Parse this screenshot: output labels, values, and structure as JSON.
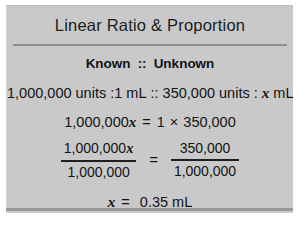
{
  "card": {
    "title": "Linear Ratio & Proportion",
    "header": {
      "known_label": "Known",
      "separator": "::",
      "unknown_label": "Unknown"
    },
    "proportion": {
      "known_quantity": "1,000,000 units",
      "known_ratio_sep": ":",
      "known_volume": "1 mL",
      "proportion_sep": "::",
      "unknown_quantity": "350,000 units",
      "unknown_ratio_sep": ":",
      "unknown_variable": "x",
      "unknown_volume": "mL",
      "full_text": "1,000,000 units :1 mL :: 350,000 units : x mL"
    },
    "cross_multiply": {
      "left_coefficient": "1,000,000",
      "left_variable": "x",
      "equals": "=",
      "right_factor_1": "1",
      "times": "×",
      "right_factor_2": "350,000",
      "full_text": "1,000,000x = 1 × 350,000"
    },
    "division_step": {
      "left_numerator": "1,000,000",
      "left_numerator_variable": "x",
      "left_denominator": "1,000,000",
      "equals": "=",
      "right_numerator": "350,000",
      "right_denominator": "1,000,000"
    },
    "answer": {
      "variable": "x",
      "equals": "=",
      "value": "0.35",
      "unit": "mL",
      "full_text": "x = 0.35 mL"
    },
    "colors": {
      "panel_background": "#c9c9c9",
      "page_background": "#ffffff",
      "text": "#131415",
      "rule": "#8d8f90",
      "bottom_rule": "#969899"
    }
  }
}
